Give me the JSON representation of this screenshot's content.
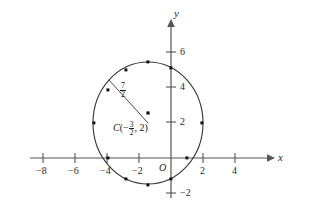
{
  "figure": {
    "type": "coordinate-plane-circle-graph",
    "axes": {
      "x_axis_label": "x",
      "y_axis_label": "y",
      "origin_label": "O",
      "x_ticks": [
        {
          "value": -8,
          "label": "−8"
        },
        {
          "value": -6,
          "label": "−6"
        },
        {
          "value": -4,
          "label": "−4"
        },
        {
          "value": -2,
          "label": "−2"
        },
        {
          "value": 2,
          "label": "2"
        },
        {
          "value": 4,
          "label": "4"
        }
      ],
      "y_ticks": [
        {
          "value": 6,
          "label": "6"
        },
        {
          "value": 4,
          "label": "4"
        },
        {
          "value": 2,
          "label": "2"
        },
        {
          "value": -2,
          "label": "−2"
        }
      ],
      "x_range": [
        -9.2,
        5.2
      ],
      "y_range": [
        -2.8,
        7.2
      ]
    },
    "circle": {
      "center_x": -1.5,
      "center_y": 2,
      "radius_numerator": "7",
      "radius_denominator": "2",
      "radius_value": 3.5,
      "stroke_color": "#3a3a3a"
    },
    "radius_label": {
      "numerator": "7",
      "denominator": "2"
    },
    "center_label": {
      "name": "C",
      "open_paren": "(−",
      "x_numerator": "3",
      "x_denominator": "2",
      "close": ", 2)"
    },
    "marked_points": [
      {
        "x": -1.5,
        "y": 5.5
      },
      {
        "x": -3.0,
        "y": 5.03
      },
      {
        "x": -4.23,
        "y": 3.52
      },
      {
        "x": -4.92,
        "y": 2.0
      },
      {
        "x": -4.32,
        "y": 0.0
      },
      {
        "x": -3.0,
        "y": -1.03
      },
      {
        "x": -1.5,
        "y": -1.5
      },
      {
        "x": 0.0,
        "y": -1.05
      },
      {
        "x": 1.02,
        "y": 0.0
      },
      {
        "x": 1.93,
        "y": 2.0
      },
      {
        "x": 0.0,
        "y": 5.16
      }
    ],
    "colors": {
      "axis": "#555555",
      "curve": "#3a3a3a",
      "text": "#1f1f1f"
    }
  }
}
